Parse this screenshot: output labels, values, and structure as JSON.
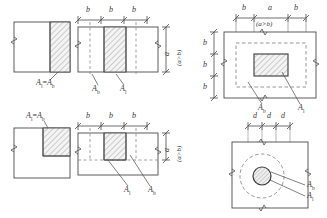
{
  "diagram": {
    "stroke_color": "#4a4a4a",
    "dash_color": "#7a7a7a",
    "hatch_color": "#8c8c8c",
    "fill_color": "#f2f2f2",
    "background": "#ffffff"
  },
  "symbols": {
    "A": "A",
    "sub_l": "l",
    "sub_b": "b",
    "equals": "=",
    "b": "b",
    "a": "a",
    "d": "d",
    "condition": "(a>b)"
  },
  "panels": [
    {
      "id": "top-left",
      "name": "edge-bearing-elevation",
      "labels": [
        {
          "name": "area-equality-label",
          "text": "Al=Ab"
        }
      ]
    },
    {
      "id": "top-middle",
      "name": "interior-bearing-elevation",
      "top_dimensions": [
        "b",
        "b",
        "b"
      ],
      "right_dimension": {
        "value": "a",
        "note": "(a>b)"
      },
      "labels": [
        {
          "name": "bearing-area-label",
          "text": "Ab"
        },
        {
          "name": "loaded-area-label",
          "text": "Al"
        }
      ]
    },
    {
      "id": "top-right",
      "name": "rectangular-bearing-plan",
      "top_dimensions": [
        "b",
        "a",
        "b"
      ],
      "top_note": "(a>b)",
      "left_dimensions": [
        "b",
        "b",
        "b"
      ],
      "labels": [
        {
          "name": "bearing-area-label",
          "text": "Ab"
        },
        {
          "name": "loaded-area-label",
          "text": "Al"
        }
      ]
    },
    {
      "id": "bottom-left",
      "name": "corner-bearing-elevation",
      "labels": [
        {
          "name": "area-equality-label",
          "text": "Al=Ab"
        }
      ]
    },
    {
      "id": "bottom-middle",
      "name": "edge-interior-bearing-elevation",
      "top_dimensions": [
        "b",
        "b",
        "b"
      ],
      "right_dimension": {
        "value": "a",
        "note": "(a>b)"
      },
      "labels": [
        {
          "name": "loaded-area-label",
          "text": "Al"
        },
        {
          "name": "bearing-area-label",
          "text": "Ab"
        }
      ]
    },
    {
      "id": "bottom-right",
      "name": "circular-bearing-plan",
      "top_dimensions": [
        "d",
        "d",
        "d"
      ],
      "labels": [
        {
          "name": "bearing-area-label",
          "text": "Ab"
        },
        {
          "name": "loaded-area-label",
          "text": "Al"
        }
      ]
    }
  ]
}
